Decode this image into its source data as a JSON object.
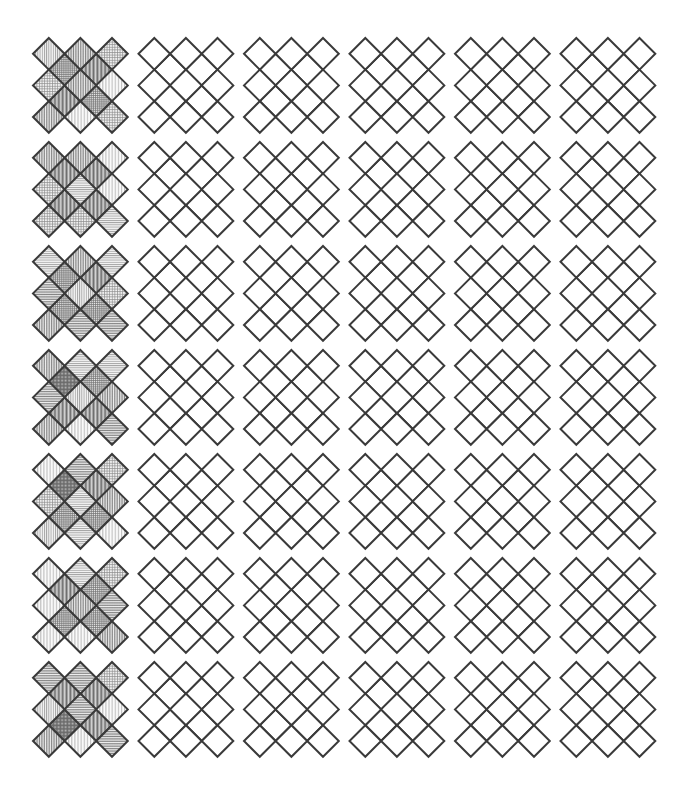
{
  "figure": {
    "name": "diamond-lattice-grid-figure",
    "background_color": "#ffffff",
    "width": 676,
    "height": 800
  },
  "chart_data": {
    "type": "heatmap",
    "title": "",
    "subtitle": "",
    "xlabel": "",
    "ylabel": "",
    "grid": false,
    "legend": null,
    "rows": 7,
    "cols": 6,
    "row_labels": [
      "1",
      "2",
      "3",
      "4",
      "5",
      "6",
      "7"
    ],
    "col_labels": [
      "1",
      "2",
      "3",
      "4",
      "5",
      "6"
    ],
    "tile_kind": "diamond-lattice",
    "lattice": {
      "nx": 3,
      "ny": 3,
      "cell_pitch_x": 31.6,
      "cell_pitch_y": 31.6,
      "diamond_half_width": 15.8,
      "diamond_half_height": 15.8,
      "include_interstitial": true
    },
    "layout": {
      "origin_x": 33,
      "origin_y": 38,
      "col_pitch": 105.5,
      "row_pitch": 104.0,
      "tile_width": 95,
      "tile_height": 95
    },
    "stroke": {
      "color": "#3a3a3a",
      "width": 2.0
    },
    "values": [
      [
        1,
        0,
        0,
        0,
        0,
        0
      ],
      [
        1,
        0,
        0,
        0,
        0,
        0
      ],
      [
        1,
        0,
        0,
        0,
        0,
        0
      ],
      [
        1,
        0,
        0,
        0,
        0,
        0
      ],
      [
        1,
        0,
        0,
        0,
        0,
        0
      ],
      [
        1,
        0,
        0,
        0,
        0,
        0
      ],
      [
        1,
        0,
        0,
        0,
        0,
        0
      ]
    ],
    "value_meaning": {
      "0": "unfilled / white diamonds",
      "1": "hatch-filled diamonds"
    },
    "fill_styles": {
      "main_diamond_hatches": [
        "vertical-light",
        "vertical-medium",
        "horizontal-light",
        "crosshatch-light",
        "vertical-sparse",
        "horizontal-medium"
      ],
      "interstitial_diamond_hatches": [
        "crosshatch-dense",
        "crosshatch-medium",
        "vertical-dense"
      ],
      "hatch_color": "#6e6e6e",
      "hatch_fill_tint": "#f2f2f2"
    }
  }
}
